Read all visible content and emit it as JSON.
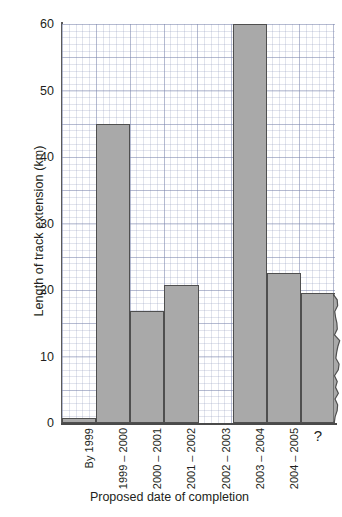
{
  "chart_data": {
    "type": "bar",
    "title": "",
    "xlabel": "Proposed date of completion",
    "ylabel": "Length of track extension (km)",
    "categories": [
      "By 1999",
      "1999 – 2000",
      "2000 – 2001",
      "2001 – 2002",
      "2002 – 2003",
      "2003 – 2004",
      "2004 – 2005",
      "?"
    ],
    "values": [
      0.8,
      45.0,
      16.8,
      20.8,
      0,
      60.0,
      22.6,
      19.6
    ],
    "ylim": [
      0,
      60
    ],
    "yticks": [
      0,
      10,
      20,
      30,
      40,
      50,
      60
    ],
    "ytick_labels": [
      "0",
      "10",
      "20",
      "30",
      "40",
      "50",
      "60"
    ],
    "grid": true,
    "grid_style": "graph-paper minor and major",
    "legend": "none",
    "notes": [
      "Bar for 2002 – 2003 has zero height (no bar drawn).",
      "Final bar labelled '?' is drawn with a ragged / torn right edge indicating an open-ended or uncertain future category."
    ],
    "colors": {
      "bar_fill": "#a9a9a9",
      "bar_edge": "#4f4f4f",
      "grid_major": "#7882aa",
      "grid_minor": "#8c96b9",
      "axis": "#4a4a4a",
      "text": "#231f20",
      "background": "#ffffff"
    }
  }
}
